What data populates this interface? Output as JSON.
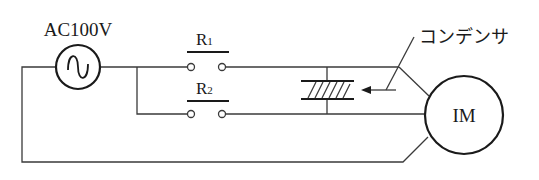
{
  "diagram": {
    "type": "circuit",
    "source": {
      "label": "AC100V",
      "symbol": "sine-wave"
    },
    "relays": [
      {
        "label": "R",
        "subscript": "1"
      },
      {
        "label": "R",
        "subscript": "2"
      }
    ],
    "capacitor": {
      "label": "コンデンサ"
    },
    "motor": {
      "label": "IM"
    },
    "colors": {
      "line": "#3a3a3a",
      "background": "#ffffff"
    }
  }
}
